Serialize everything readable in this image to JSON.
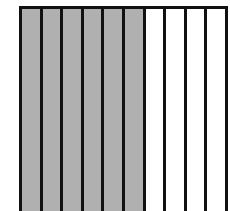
{
  "diagram": {
    "total_strips": 10,
    "shaded_strips": 6,
    "fraction_shaded": "6/10",
    "colors": {
      "shaded": "#b0b0b0",
      "unshaded": "#ffffff",
      "line": "#111111"
    },
    "strips": [
      {
        "shaded": true
      },
      {
        "shaded": true
      },
      {
        "shaded": true
      },
      {
        "shaded": true
      },
      {
        "shaded": true
      },
      {
        "shaded": true
      },
      {
        "shaded": false
      },
      {
        "shaded": false
      },
      {
        "shaded": false
      },
      {
        "shaded": false
      }
    ]
  }
}
